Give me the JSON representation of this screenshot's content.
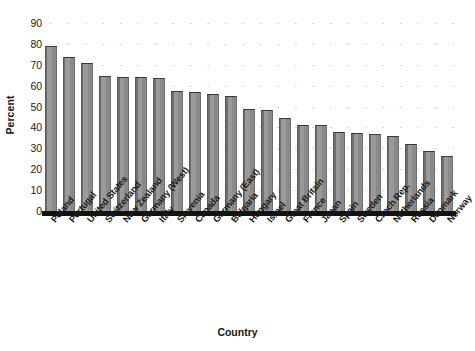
{
  "chart_data": {
    "type": "bar",
    "title": "",
    "xlabel": "Country",
    "ylabel": "Percent",
    "ylim": [
      0,
      90
    ],
    "ytick_values": [
      0,
      10,
      20,
      30,
      40,
      50,
      60,
      70,
      80,
      90
    ],
    "ytick_labels": [
      "0",
      "10",
      "20",
      "30",
      "40",
      "50",
      "60",
      "70",
      "80",
      "90"
    ],
    "grid": "dotted-faint",
    "legend": "none",
    "bar_color": "#8c8c8c",
    "bar_edge_color": "#3a3a3a",
    "axis_color": "#121212",
    "categories": [
      "Poland",
      "Portugal",
      "United States",
      "Switzerland",
      "New Zealand",
      "Germany (West)",
      "Italy",
      "Slovenia",
      "Canada",
      "Germany (East)",
      "Bulgaria",
      "Hungary",
      "Israel",
      "Great Britain",
      "France",
      "Japan",
      "Spain",
      "Sweden",
      "Czech Rep.",
      "Netherlands",
      "Russia",
      "Denmark",
      "Norway"
    ],
    "values": [
      79,
      73.5,
      71,
      64.5,
      64,
      64,
      63.5,
      57.5,
      57,
      56,
      55,
      49,
      48.5,
      44.5,
      41,
      41,
      38,
      37.5,
      37,
      36,
      32,
      28.5,
      26.5
    ]
  }
}
